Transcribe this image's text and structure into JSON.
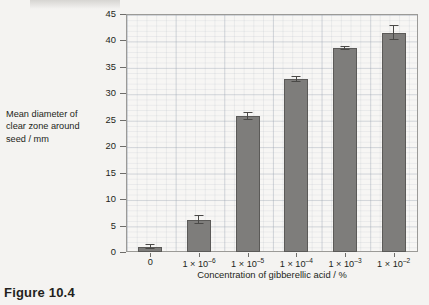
{
  "caption": "Figure 10.4",
  "chart_data": {
    "type": "bar",
    "title": "",
    "xlabel": "Concentration of gibberellic acid / %",
    "ylabel": "Mean diameter of clear zone around seed / mm",
    "ylim": [
      0,
      45
    ],
    "ytick_step": 5,
    "yticks": [
      0,
      5,
      10,
      15,
      20,
      25,
      30,
      35,
      40,
      45
    ],
    "grid": true,
    "legend": "none",
    "categories": [
      "0",
      "1 × 10⁻⁶",
      "1 × 10⁻⁵",
      "1 × 10⁻⁴",
      "1 × 10⁻³",
      "1 × 10⁻²"
    ],
    "category_parts": [
      {
        "base": "0",
        "exp": ""
      },
      {
        "base": "1 × 10",
        "exp": "–6"
      },
      {
        "base": "1 × 10",
        "exp": "–5"
      },
      {
        "base": "1 × 10",
        "exp": "–4"
      },
      {
        "base": "1 × 10",
        "exp": "–3"
      },
      {
        "base": "1 × 10",
        "exp": "–2"
      }
    ],
    "values": [
      1.0,
      6.1,
      25.7,
      32.7,
      38.6,
      41.5
    ],
    "errors": [
      0.5,
      0.9,
      0.8,
      0.6,
      0.4,
      1.5
    ],
    "bar_color": "#7e7d7b",
    "bar_edge_color": "#5b5a58",
    "error_bar_color": "#4a4947"
  },
  "ylabel_lines": [
    "Mean diameter of",
    "clear zone around",
    "seed / mm"
  ]
}
